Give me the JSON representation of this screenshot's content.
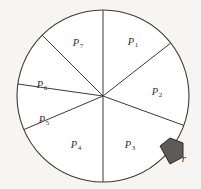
{
  "figure": {
    "name": "circle-sector-partition",
    "background_color": "#f6f5f3",
    "circle": {
      "center_x": 103,
      "center_y": 96,
      "radius": 86,
      "fill_color": "#ffffff",
      "stroke_color": "#3c3a38",
      "stroke_width": 1.1
    },
    "divider_stroke_color": "#3c3a38",
    "divider_stroke_width": 1.0,
    "boundary_angles_deg": [
      90,
      38,
      -20,
      -90,
      -157,
      172,
      135
    ],
    "sectors": [
      {
        "id": "P1",
        "label": "P",
        "subscript": "1",
        "label_x": 133,
        "label_y": 42,
        "start_angle_deg": 38,
        "end_angle_deg": 90
      },
      {
        "id": "P2",
        "label": "P",
        "subscript": "2",
        "label_x": 157,
        "label_y": 92,
        "start_angle_deg": -20,
        "end_angle_deg": 38
      },
      {
        "id": "P3",
        "label": "P",
        "subscript": "3",
        "label_x": 130,
        "label_y": 145,
        "start_angle_deg": -90,
        "end_angle_deg": -20
      },
      {
        "id": "P4",
        "label": "P",
        "subscript": "4",
        "label_x": 76,
        "label_y": 145,
        "start_angle_deg": -157,
        "end_angle_deg": -90
      },
      {
        "id": "P5",
        "label": "P",
        "subscript": "5",
        "label_x": 44,
        "label_y": 120,
        "start_angle_deg": 172,
        "end_angle_deg": 203
      },
      {
        "id": "P6",
        "label": "P",
        "subscript": "6",
        "label_x": 42,
        "label_y": 85,
        "start_angle_deg": 135,
        "end_angle_deg": 172
      },
      {
        "id": "P7",
        "label": "P",
        "subscript": "7",
        "label_x": 78,
        "label_y": 43,
        "start_angle_deg": 90,
        "end_angle_deg": 135
      }
    ],
    "pointer": {
      "name": "radius-pointer-arrow",
      "label": "r",
      "label_x": 184,
      "label_y": 158,
      "fill_color": "#5d5b59",
      "stroke_color": "#2e2c2a",
      "stroke_width": 1.0,
      "points": "160,146 170,138 183,143 183,157 170,164"
    }
  }
}
